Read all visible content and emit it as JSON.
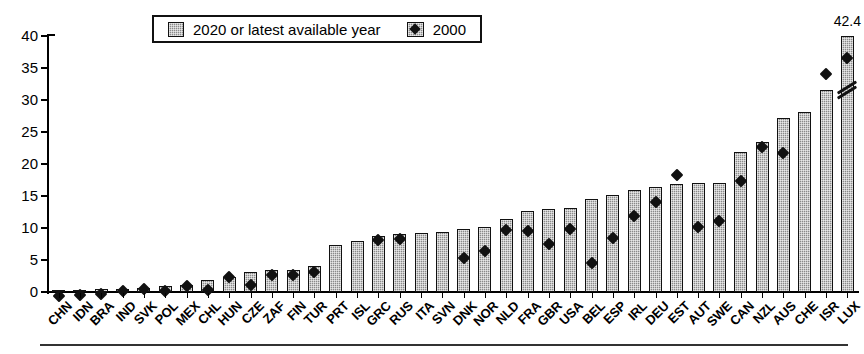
{
  "legend": {
    "position": "top-center",
    "entries": [
      {
        "label": "2020 or latest available year",
        "marker": "filled-square-hatched",
        "color": "#8a8a8a"
      },
      {
        "label": "2000",
        "marker": "black-diamond",
        "color": "#111111"
      }
    ]
  },
  "axis": {
    "y_ticks": [
      "0",
      "5",
      "10",
      "15",
      "20",
      "25",
      "30",
      "35",
      "40"
    ]
  },
  "annotations": {
    "lux_value_label": "42.4"
  },
  "chart_data": {
    "type": "bar",
    "title": "",
    "subtitle": "",
    "xlabel": "",
    "ylabel": "",
    "ylim": [
      0,
      40
    ],
    "ytick_step": 5,
    "grid": false,
    "legend_position": "top-center",
    "note": "LUX bar is truncated with an axis-break mark; its true value 42.4 is printed above the bar.",
    "categories": [
      "CHN",
      "IDN",
      "BRA",
      "IND",
      "SVK",
      "POL",
      "MEX",
      "CHL",
      "HUN",
      "CZE",
      "ZAF",
      "FIN",
      "TUR",
      "PRT",
      "ISL",
      "GRC",
      "RUS",
      "ITA",
      "SVN",
      "DNK",
      "NOR",
      "NLD",
      "FRA",
      "GBR",
      "USA",
      "BEL",
      "ESP",
      "IRL",
      "DEU",
      "EST",
      "AUT",
      "SWE",
      "CAN",
      "NZL",
      "AUS",
      "CHE",
      "ISR",
      "LUX"
    ],
    "series": [
      {
        "name": "2020 or latest available year",
        "color": "#8a8a8a",
        "values": [
          0.2,
          0.3,
          0.4,
          0.5,
          0.7,
          0.9,
          1.1,
          1.9,
          2.4,
          3.2,
          3.4,
          3.4,
          4.0,
          7.4,
          8.0,
          8.8,
          9.0,
          9.2,
          9.4,
          9.9,
          10.2,
          11.4,
          12.6,
          12.9,
          13.2,
          14.6,
          15.2,
          16.0,
          16.4,
          16.8,
          17.0,
          17.1,
          21.8,
          23.5,
          27.2,
          28.1,
          31.6,
          42.4
        ]
      },
      {
        "name": "2000",
        "color": "#111111",
        "values": [
          0.1,
          0.2,
          0.4,
          0.8,
          1.1,
          0.8,
          1.7,
          1.0,
          3.1,
          1.8,
          3.4,
          3.4,
          3.9,
          null,
          null,
          8.9,
          9.0,
          null,
          null,
          6.0,
          7.1,
          10.4,
          10.2,
          8.2,
          10.5,
          5.2,
          9.1,
          12.6,
          14.7,
          19.0,
          10.9,
          11.8,
          18.1,
          23.3,
          22.4,
          null,
          34.8,
          37.2
        ]
      }
    ]
  }
}
